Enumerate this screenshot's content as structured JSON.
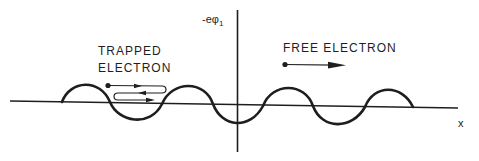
{
  "diagram": {
    "axis_y_label": "-eφ",
    "axis_y_label_subscript": "1",
    "axis_x_label": "x",
    "trapped_label_line1": "TRAPPED",
    "trapped_label_line2": "ELECTRON",
    "free_label": "FREE ELECTRON",
    "colors": {
      "ink": "#1e1e1e",
      "background": "#ffffff"
    }
  }
}
